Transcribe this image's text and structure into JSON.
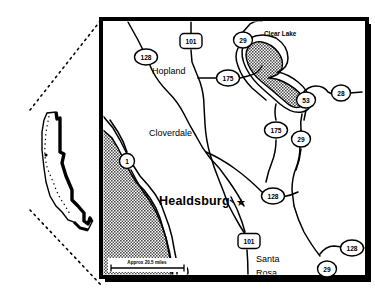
{
  "figure": {
    "kind": "locator-map",
    "background_color": "#ffffff",
    "ink_color": "#000000",
    "water_fill_color": "#8a8a8a"
  },
  "inset": {
    "name": "california-state-outline",
    "label": "",
    "leader_line_style": "dotted"
  },
  "main_map": {
    "frame_style": "thick-black-with-drop-shadow",
    "water_bodies": [
      {
        "name": "pacific-ocean",
        "label": ""
      },
      {
        "name": "clear-lake",
        "label": "Clear Lake"
      }
    ],
    "places": [
      {
        "name": "hopland",
        "label": "Hopland",
        "x": 152,
        "y": 74,
        "style": "plain"
      },
      {
        "name": "cloverdale",
        "label": "Cloverdale",
        "x": 149,
        "y": 132,
        "style": "plain"
      },
      {
        "name": "healdsburg",
        "label": "Healdsburg",
        "x": 145,
        "y": 201,
        "style": "bold-with-star"
      },
      {
        "name": "santa-rosa-1",
        "label": "Santa",
        "x": 257,
        "y": 259,
        "style": "plain"
      },
      {
        "name": "santa-rosa-2",
        "label": "Rosa",
        "x": 257,
        "y": 274,
        "style": "plain"
      }
    ],
    "city_marker": {
      "name": "healdsburg-star",
      "glyph": "star"
    },
    "highway_shields": [
      {
        "name": "shield-128-hopland",
        "number": "128",
        "shape": "circle",
        "cx": 146,
        "cy": 57
      },
      {
        "name": "shield-101-north",
        "number": "101",
        "shape": "rounded-rect",
        "cx": 191,
        "cy": 42
      },
      {
        "name": "shield-29-clearlake",
        "number": "29",
        "shape": "circle",
        "cx": 243,
        "cy": 40
      },
      {
        "name": "shield-175-north",
        "number": "175",
        "shape": "circle",
        "cx": 228,
        "cy": 78
      },
      {
        "name": "shield-53",
        "number": "53",
        "shape": "circle",
        "cx": 306,
        "cy": 100
      },
      {
        "name": "shield-28",
        "number": "28",
        "shape": "circle",
        "cx": 341,
        "cy": 93
      },
      {
        "name": "shield-175-south",
        "number": "175",
        "shape": "circle",
        "cx": 276,
        "cy": 130
      },
      {
        "name": "shield-29-mid",
        "number": "29",
        "shape": "circle",
        "cx": 301,
        "cy": 139
      },
      {
        "name": "shield-1-coast",
        "number": "1",
        "shape": "circle",
        "cx": 127,
        "cy": 161
      },
      {
        "name": "shield-128-healdsburg",
        "number": "128",
        "shape": "circle",
        "cx": 273,
        "cy": 196
      },
      {
        "name": "shield-101-south",
        "number": "101",
        "shape": "rounded-rect",
        "cx": 249,
        "cy": 241
      },
      {
        "name": "shield-128-southeast",
        "number": "128",
        "shape": "circle",
        "cx": 352,
        "cy": 248
      },
      {
        "name": "shield-29-south",
        "number": "29",
        "shape": "circle",
        "cx": 327,
        "cy": 269
      }
    ],
    "scale_bar": {
      "name": "scale-bar",
      "label": "Approx 20.5 miles",
      "distance_value": "20.5",
      "distance_unit": "miles"
    }
  }
}
